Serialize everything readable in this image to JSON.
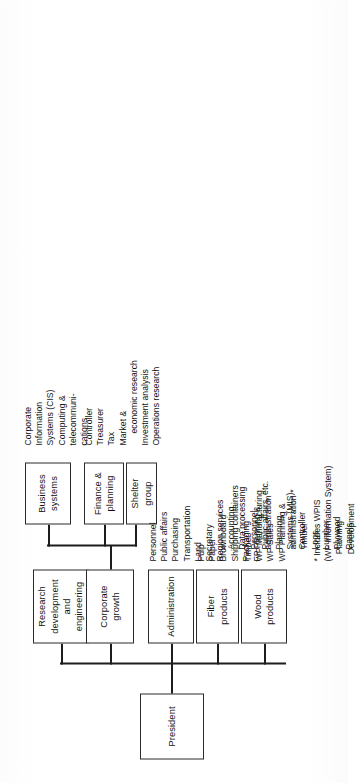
{
  "chart": {
    "title_root": "President",
    "footnote": "* Includes WPIS\n(WP Information System)\n   Planning\n   Development",
    "nodes": {
      "president": "President",
      "wood_products": "Wood\nproducts",
      "fiber_products": "Fiber\nproducts",
      "administration": "Administration",
      "corporate_growth": "Corporate\ngrowth",
      "research": "Research\ndevelopment\nand\nengineering",
      "shelter_group": "Shelter\ngroup",
      "finance_planning": "Finance &\nplanning",
      "business_systems": "Business\nsystems"
    },
    "lists": {
      "wood_products": [
        {
          "text": "Timber",
          "level": 0
        },
        {
          "text": "WP Manufacturing",
          "level": 0
        },
        {
          "text": "WP Sales",
          "level": 0
        },
        {
          "text": "WP Planning &",
          "level": 0
        },
        {
          "text": "administration *",
          "level": 1
        },
        {
          "text": "Timber",
          "level": 1
        },
        {
          "text": "Logs",
          "level": 1
        },
        {
          "text": "Lumber",
          "level": 1
        },
        {
          "text": "Plywood",
          "level": 1
        },
        {
          "text": "Panels",
          "level": 1
        }
      ],
      "fiber_products": [
        {
          "text": "Pulp",
          "level": 0
        },
        {
          "text": "Paper",
          "level": 0
        },
        {
          "text": "Brownboard",
          "level": 0
        },
        {
          "text": "Shipping containers",
          "level": 0
        },
        {
          "text": "Packaging",
          "level": 0
        },
        {
          "text": "FP Planning &",
          "level": 0
        },
        {
          "text": "administration",
          "level": 1
        },
        {
          "text": "Planning",
          "level": 1
        },
        {
          "text": "Systems (MIS)",
          "level": 1
        },
        {
          "text": "Controller",
          "level": 1
        }
      ],
      "administration": [
        {
          "text": "Personnel",
          "level": 0
        },
        {
          "text": "Public affairs",
          "level": 0
        },
        {
          "text": "Purchasing",
          "level": 0
        },
        {
          "text": "Transportation",
          "level": 0
        },
        {
          "text": "Land",
          "level": 0
        },
        {
          "text": "Secretary",
          "level": 0
        },
        {
          "text": "Region services",
          "level": 0
        },
        {
          "text": "Accounting",
          "level": 1
        },
        {
          "text": "Data processing",
          "level": 1
        },
        {
          "text": "Personnel",
          "level": 1
        },
        {
          "text": "Public affairs, etc.",
          "level": 1
        }
      ],
      "finance_planning": [
        {
          "text": "Controller",
          "level": 0
        },
        {
          "text": "Treasurer",
          "level": 0
        },
        {
          "text": "Tax",
          "level": 0
        },
        {
          "text": "Market &",
          "level": 0
        },
        {
          "text": "economic research",
          "level": 1
        },
        {
          "text": "Investment analysis",
          "level": 0
        },
        {
          "text": "Operations research",
          "level": 0
        }
      ],
      "business_systems": [
        {
          "text": "Corporate",
          "level": 0
        },
        {
          "text": "Information",
          "level": 0
        },
        {
          "text": "Systems (CIS)",
          "level": 0
        },
        {
          "text": "Computing &",
          "level": 0
        },
        {
          "text": "telecommuni-",
          "level": 0
        },
        {
          "text": "cations",
          "level": 0
        }
      ]
    }
  },
  "colors": {
    "ink": "#111111",
    "rule": "#1d1d1d",
    "page": "#ffffff"
  }
}
